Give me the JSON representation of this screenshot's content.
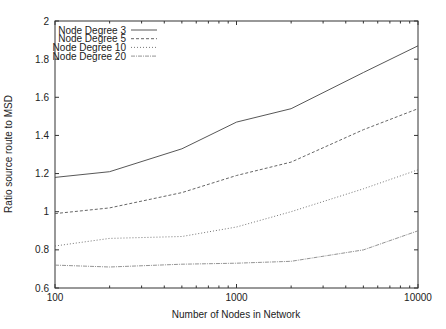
{
  "chart_data": {
    "type": "line",
    "title": "",
    "xlabel": "Number of Nodes in Network",
    "ylabel": "Ratio source route to MSD",
    "xscale": "log",
    "xlim": [
      100,
      10000
    ],
    "ylim": [
      0.6,
      2.0
    ],
    "xticks": [
      100,
      1000,
      10000
    ],
    "xtick_labels": [
      "100",
      "1000",
      "10000"
    ],
    "yticks": [
      0.6,
      0.8,
      1.0,
      1.2,
      1.4,
      1.6,
      1.8,
      2.0
    ],
    "ytick_labels": [
      "0.6",
      "0.8",
      "1",
      "1.2",
      "1.4",
      "1.6",
      "1.8",
      "2"
    ],
    "grid": false,
    "legend_position": "upper left",
    "x": [
      100,
      200,
      500,
      1000,
      2000,
      5000,
      10000
    ],
    "series": [
      {
        "name": "Node Degree 3",
        "style": "solid",
        "values": [
          1.18,
          1.21,
          1.33,
          1.47,
          1.54,
          1.73,
          1.87
        ]
      },
      {
        "name": "Node Degree 5",
        "style": "dashed",
        "values": [
          0.99,
          1.02,
          1.1,
          1.19,
          1.26,
          1.43,
          1.54
        ]
      },
      {
        "name": "Node Degree 10",
        "style": "dotted",
        "values": [
          0.82,
          0.86,
          0.87,
          0.92,
          1.0,
          1.12,
          1.22
        ]
      },
      {
        "name": "Node Degree 20",
        "style": "dashdot",
        "values": [
          0.72,
          0.71,
          0.725,
          0.73,
          0.74,
          0.8,
          0.9
        ]
      }
    ]
  },
  "colors": {
    "axis": "#333333",
    "series": [
      "#444444",
      "#555555",
      "#666666",
      "#888888"
    ]
  }
}
